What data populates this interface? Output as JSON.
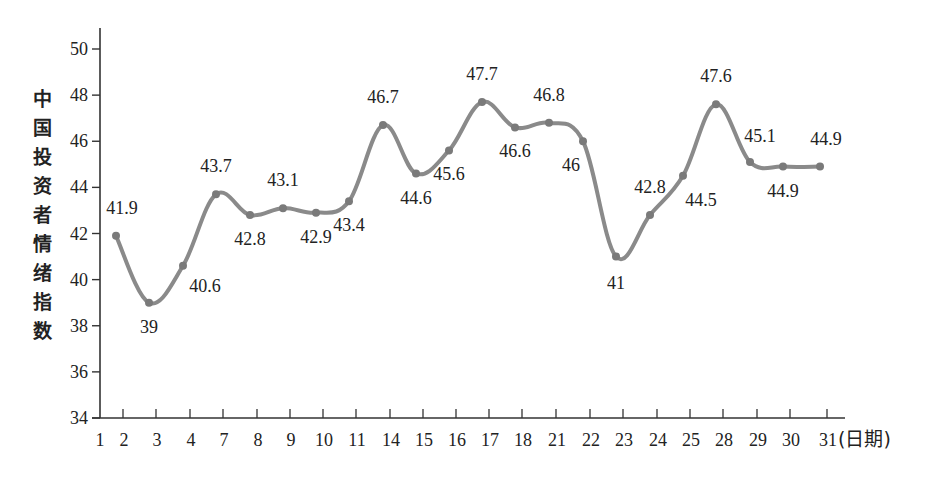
{
  "chart_data": {
    "type": "line",
    "title": "",
    "xlabel": "(日期)",
    "ylabel": "中国投资者情绪指数",
    "ylim": [
      34,
      50
    ],
    "yticks": [
      34,
      36,
      38,
      40,
      42,
      44,
      46,
      48,
      50
    ],
    "grid": false,
    "legend": null,
    "x_origin_label": "1",
    "categories": [
      "2",
      "3",
      "4",
      "7",
      "8",
      "9",
      "10",
      "11",
      "14",
      "15",
      "16",
      "17",
      "18",
      "21",
      "22",
      "23",
      "24",
      "25",
      "28",
      "29",
      "30",
      "31"
    ],
    "values": [
      41.9,
      39,
      40.6,
      43.7,
      42.8,
      43.1,
      42.9,
      43.4,
      46.7,
      44.6,
      45.6,
      47.7,
      46.6,
      46.8,
      46,
      41,
      42.8,
      44.5,
      47.6,
      45.1,
      44.9,
      44.9
    ],
    "data_labels": [
      "41.9",
      "39",
      "40.6",
      "43.7",
      "42.8",
      "43.1",
      "42.9",
      "43.4",
      "46.7",
      "44.6",
      "45.6",
      "47.7",
      "46.6",
      "46.8",
      "46",
      "41",
      "42.8",
      "44.5",
      "47.6",
      "45.1",
      "44.9",
      "44.9"
    ],
    "series_color": "#8a8a8a",
    "smooth": true
  }
}
